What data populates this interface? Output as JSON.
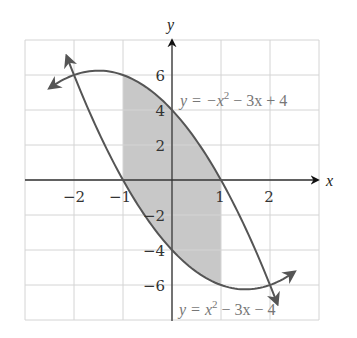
{
  "figure": {
    "x_axis_label": "x",
    "y_axis_label": "y",
    "x_tick_labels": [
      "−2",
      "−1",
      "1",
      "2"
    ],
    "y_tick_labels": [
      "6",
      "4",
      "2",
      "−2",
      "−4",
      "−6"
    ],
    "curve_upper_label": {
      "prefix": "y = −x",
      "exp": "2",
      "suffix": " − 3x + 4"
    },
    "curve_lower_label": {
      "prefix": "y = x",
      "exp": "2",
      "suffix": " − 3x − 4"
    },
    "colors": {
      "grid": "#d4d4d4",
      "axis": "#333333",
      "curve": "#555555",
      "shade": "#c8c8c8",
      "label": "#777777"
    }
  },
  "chart_data": {
    "type": "line",
    "title": "",
    "xlabel": "x",
    "ylabel": "y",
    "xlim": [
      -3,
      3
    ],
    "ylim": [
      -8,
      8
    ],
    "grid": true,
    "x_ticks": [
      -2,
      -1,
      1,
      2
    ],
    "y_ticks": [
      -6,
      -4,
      -2,
      2,
      4,
      6
    ],
    "series": [
      {
        "name": "y = -x^2 - 3x + 4",
        "x": [
          -2.5,
          -2,
          -1.5,
          -1,
          -0.5,
          0,
          0.5,
          1,
          1.5,
          2,
          2.15
        ],
        "values": [
          5.25,
          6,
          6.25,
          6,
          5.25,
          4,
          2.25,
          0,
          -2.75,
          -6,
          -7.07
        ]
      },
      {
        "name": "y = x^2 - 3x - 4",
        "x": [
          -2.15,
          -2,
          -1.5,
          -1,
          -0.5,
          0,
          0.5,
          1,
          1.5,
          2,
          2.5
        ],
        "values": [
          7.07,
          6,
          2.75,
          0,
          -2.25,
          -4,
          -5.25,
          -6,
          -6.25,
          -6,
          -5.25
        ]
      }
    ],
    "shaded_region": {
      "between": [
        "y = -x^2 - 3x + 4",
        "y = x^2 - 3x - 4"
      ],
      "x_from": -1,
      "x_to": 1
    },
    "annotations": [
      "y = −x² − 3x + 4",
      "y = x² − 3x − 4"
    ]
  }
}
